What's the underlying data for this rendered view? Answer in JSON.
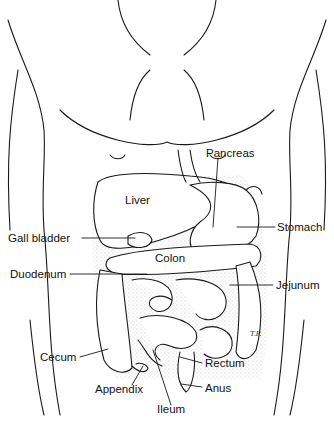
{
  "diagram": {
    "labels": {
      "pancreas": "Pancreas",
      "liver": "Liver",
      "stomach": "Stomach",
      "gall_bladder": "Gall bladder",
      "colon": "Colon",
      "duodenum": "Duodenum",
      "jejunum": "Jejunum",
      "cecum": "Cecum",
      "rectum": "Rectum",
      "appendix": "Appendix",
      "anus": "Anus",
      "ileum": "Ileum"
    },
    "signature": "T.P.",
    "colors": {
      "line": "#1a1a1a",
      "background": "#ffffff",
      "stipple": "#9a9a9a"
    }
  }
}
